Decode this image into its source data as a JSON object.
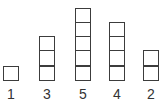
{
  "diagram": {
    "line_color": "#3c3c3c",
    "label_color": "#333333",
    "columns": [
      {
        "label": "1",
        "count": 1,
        "x": 3
      },
      {
        "label": "3",
        "count": 3,
        "x": 39
      },
      {
        "label": "5",
        "count": 5,
        "x": 75
      },
      {
        "label": "4",
        "count": 4,
        "x": 109
      },
      {
        "label": "2",
        "count": 2,
        "x": 143
      }
    ]
  }
}
